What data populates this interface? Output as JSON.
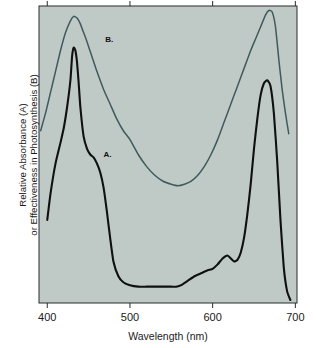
{
  "figure": {
    "background_color": "#ffffff",
    "plot_background_color": "#bfcac6",
    "frame_color": "#2b2b2b"
  },
  "chart_data": {
    "type": "line",
    "title": "",
    "xlabel": "Wavelength (nm)",
    "ylabel": "Relative Absorbance (A)\nor Effectiveness in Photosynthesis (B)",
    "ylabel_line1": "Relative Absorbance (A)",
    "ylabel_line2": "or Effectiveness in Photosynthesis (B)",
    "xlim": [
      390,
      702
    ],
    "ylim": [
      0,
      100
    ],
    "xticks": [
      400,
      500,
      600,
      700
    ],
    "xtick_labels": [
      "400",
      "500",
      "600",
      "700"
    ],
    "yticks": [],
    "ytick_labels": [],
    "grid": false,
    "legend_position": "inline-annotations",
    "annotations": [
      {
        "text": "B.",
        "x": 470,
        "y": 88,
        "color": "#111111"
      },
      {
        "text": "A.",
        "x": 468,
        "y": 49,
        "color": "#111111"
      }
    ],
    "series": [
      {
        "name": "A.",
        "label": "Relative Absorbance (A) - chlorophyll absorption spectrum",
        "color": "#101010",
        "line_width": 2.1,
        "x": [
          400,
          404,
          410,
          416,
          420,
          424,
          428,
          430,
          432,
          434,
          436,
          438,
          440,
          444,
          448,
          452,
          456,
          460,
          464,
          468,
          472,
          476,
          480,
          486,
          492,
          500,
          510,
          520,
          530,
          540,
          550,
          556,
          562,
          570,
          578,
          586,
          594,
          600,
          606,
          612,
          618,
          622,
          626,
          630,
          634,
          638,
          642,
          646,
          650,
          654,
          658,
          662,
          666,
          670,
          674,
          678,
          682,
          686,
          690,
          694
        ],
        "y": [
          28,
          37,
          47,
          54,
          59,
          66,
          75,
          83,
          86,
          85,
          81,
          74,
          66,
          56,
          52,
          50,
          49,
          47,
          44,
          39,
          31,
          22,
          14,
          9,
          7,
          6,
          5.5,
          5.5,
          5.5,
          5.5,
          5.5,
          5.5,
          6,
          7.5,
          9,
          10,
          11,
          11.5,
          13,
          15,
          16,
          15,
          14,
          14.5,
          17,
          22,
          30,
          40,
          52,
          62,
          70,
          74,
          75,
          73,
          64,
          48,
          28,
          12,
          4,
          1
        ]
      },
      {
        "name": "B.",
        "label": "Effectiveness in Photosynthesis (B) - action spectrum",
        "color": "#3f5a5c",
        "line_width": 1.5,
        "x": [
          392,
          398,
          404,
          410,
          416,
          422,
          428,
          432,
          436,
          440,
          444,
          448,
          454,
          460,
          468,
          476,
          484,
          492,
          500,
          510,
          520,
          530,
          540,
          550,
          558,
          566,
          574,
          582,
          590,
          598,
          606,
          614,
          622,
          630,
          638,
          646,
          652,
          658,
          664,
          668,
          672,
          676,
          680,
          684,
          688,
          692
        ],
        "y": [
          58,
          64,
          71,
          78,
          85,
          91,
          95,
          96.5,
          96,
          94,
          91,
          88,
          83,
          78,
          72,
          67,
          62,
          58,
          55,
          50,
          46,
          43,
          41,
          40,
          39.5,
          40,
          41,
          43,
          46,
          50,
          55,
          61,
          67,
          73,
          79,
          85,
          89,
          93,
          97,
          98.5,
          98,
          93,
          82,
          72,
          64,
          57
        ]
      }
    ]
  },
  "x_axis": {
    "title": "Wavelength (nm)",
    "ticks": [
      {
        "value": 400,
        "label": "400"
      },
      {
        "value": 500,
        "label": "500"
      },
      {
        "value": 600,
        "label": "600"
      },
      {
        "value": 700,
        "label": "700"
      }
    ]
  },
  "y_axis": {
    "title_line1": "Relative Absorbance (A)",
    "title_line2": "or Effectiveness in Photosynthesis (B)"
  },
  "curve_labels": {
    "a": "A.",
    "b": "B."
  }
}
